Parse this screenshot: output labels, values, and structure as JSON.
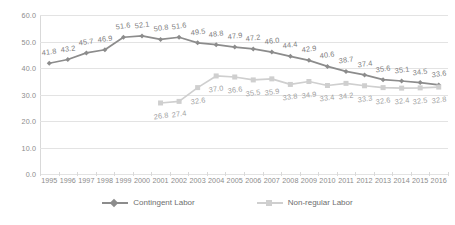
{
  "chart_data": {
    "type": "line",
    "title": "",
    "subtitle": "",
    "xlabel": "",
    "ylabel": "",
    "ylim": [
      0.0,
      60.0
    ],
    "y_ticks": [
      "0.0",
      "10.0",
      "20.0",
      "30.0",
      "40.0",
      "50.0",
      "60.0"
    ],
    "y_tick_values": [
      0.0,
      10.0,
      20.0,
      30.0,
      40.0,
      50.0,
      60.0
    ],
    "grid": "horizontal",
    "legend_position": "bottom-center",
    "categories": [
      "1995",
      "1996",
      "1997",
      "1998",
      "1999",
      "2000",
      "2001",
      "2002",
      "2003",
      "2004",
      "2005",
      "2006",
      "2007",
      "2008",
      "2009",
      "2010",
      "2011",
      "2012",
      "2013",
      "2014",
      "2015",
      "2016"
    ],
    "series": [
      {
        "name": "Contingent Labor",
        "color": "#8c8c8c",
        "marker": "diamond",
        "values": [
          41.8,
          43.2,
          45.7,
          46.9,
          51.6,
          52.1,
          50.8,
          51.6,
          49.5,
          48.8,
          47.9,
          47.2,
          46.0,
          44.4,
          42.9,
          40.6,
          38.7,
          37.4,
          35.6,
          35.1,
          34.5,
          33.6
        ],
        "labels": [
          "41.8",
          "43.2",
          "45.7",
          "46.9",
          "51.6",
          "52.1",
          "50.8",
          "51.6",
          "49.5",
          "48.8",
          "47.9",
          "47.2",
          "46.0",
          "44.4",
          "42.9",
          "40.6",
          "38.7",
          "37.4",
          "35.6",
          "35.1",
          "34.5",
          "33.6"
        ]
      },
      {
        "name": "Non-regular Labor",
        "color": "#cfcfcf",
        "marker": "square",
        "values": [
          null,
          null,
          null,
          null,
          null,
          null,
          26.8,
          27.4,
          32.6,
          37.0,
          36.6,
          35.5,
          35.9,
          33.8,
          34.9,
          33.4,
          34.2,
          33.3,
          32.6,
          32.4,
          32.5,
          32.8
        ],
        "labels": [
          "",
          "",
          "",
          "",
          "",
          "",
          "26.8",
          "27.4",
          "32.6",
          "37.0",
          "36.6",
          "35.5",
          "35.9",
          "33.8",
          "34.9",
          "33.4",
          "34.2",
          "33.3",
          "32.6",
          "32.4",
          "32.5",
          "32.8"
        ]
      }
    ]
  },
  "legend": {
    "items": [
      {
        "label": "Contingent Labor",
        "color": "#8c8c8c",
        "marker": "diamond"
      },
      {
        "label": "Non-regular Labor",
        "color": "#cfcfcf",
        "marker": "square"
      }
    ]
  },
  "colors": {
    "background": "#ffffff",
    "gridline": "#e3e3e3",
    "axis": "#d9d9d9",
    "tick_text": "#8c8c8c",
    "series_primary": "#8c8c8c",
    "series_secondary": "#cfcfcf"
  }
}
